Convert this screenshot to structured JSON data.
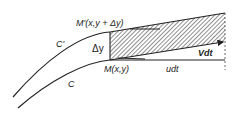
{
  "diagram": {
    "labels": {
      "curve_upper": "C'",
      "curve_lower": "C",
      "point_upper": "M'(x,y + Δy)",
      "point_lower": "M(x,y)",
      "delta_y": "Δy",
      "vector_v": "Vdt",
      "vector_u": "udt"
    },
    "colors": {
      "ink": "#222222",
      "background": "#ffffff"
    }
  }
}
